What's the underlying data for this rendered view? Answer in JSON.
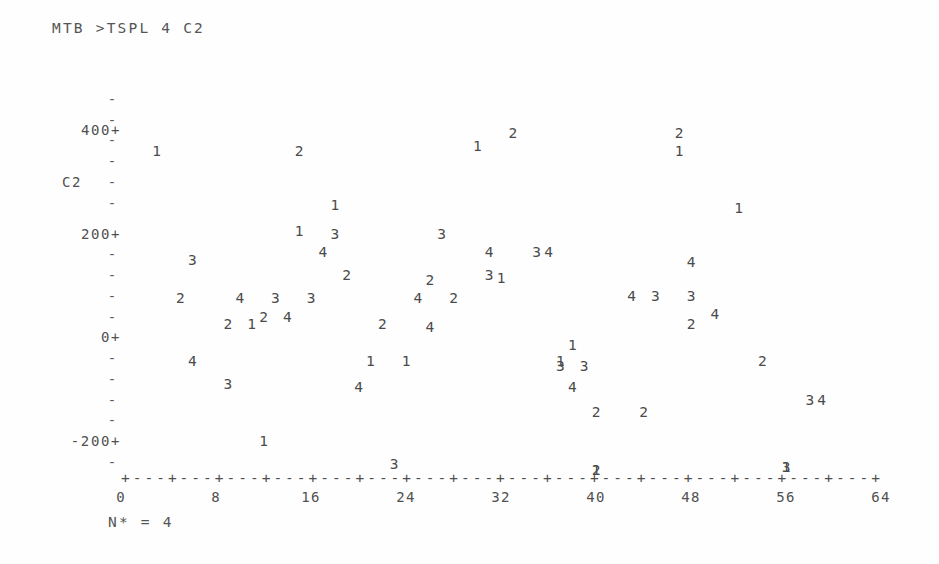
{
  "command": {
    "prompt": "MTB >",
    "text": "MTB >TSPL 4 C2"
  },
  "footer": {
    "missing_note": "N* = 4"
  },
  "chart_data": {
    "type": "scatter",
    "title": "MTB >TSPL 4 C2",
    "subtitle": "",
    "xlabel": "",
    "ylabel": "C2",
    "plot_style": "minitab-character-timeseries-plot",
    "grid": false,
    "legend": "none",
    "point_glyphs": "digit 1-4 marks season/series index within each period of 4",
    "xlim": [
      0,
      64
    ],
    "ylim": [
      -260,
      470
    ],
    "x_tick_interval": 4,
    "x_labeled_interval": 8,
    "x_tick_labels": [
      "0",
      "8",
      "16",
      "24",
      "32",
      "40",
      "48",
      "56",
      "64"
    ],
    "x_tick_values": [
      0,
      8,
      16,
      24,
      32,
      40,
      48,
      56,
      64
    ],
    "y_tick_labels": [
      "400+",
      "200+",
      "0+",
      "-200+"
    ],
    "y_tick_values": [
      400,
      200,
      0,
      -200
    ],
    "y_minor_tick_values": [
      460,
      420,
      380,
      340,
      300,
      260,
      160,
      120,
      80,
      40,
      -40,
      -80,
      -120,
      -160,
      -240
    ],
    "axis_line_glyph": "+---+---+---+---+---+---+---+---+---+---+---+---+---+---+---+---+",
    "annotations": [
      "N* = 4"
    ],
    "points": [
      {
        "label": "1",
        "x": 3,
        "y": 360
      },
      {
        "label": "2",
        "x": 15,
        "y": 360
      },
      {
        "label": "3",
        "x": 6,
        "y": 150
      },
      {
        "label": "2",
        "x": 5,
        "y": 75
      },
      {
        "label": "4",
        "x": 6,
        "y": -45
      },
      {
        "label": "3",
        "x": 9,
        "y": -90
      },
      {
        "label": "2",
        "x": 9,
        "y": 25
      },
      {
        "label": "1",
        "x": 11,
        "y": 25
      },
      {
        "label": "4",
        "x": 10,
        "y": 75
      },
      {
        "label": "2",
        "x": 12,
        "y": 40
      },
      {
        "label": "1",
        "x": 12,
        "y": -200
      },
      {
        "label": "3",
        "x": 13,
        "y": 75
      },
      {
        "label": "4",
        "x": 14,
        "y": 40
      },
      {
        "label": "1",
        "x": 15,
        "y": 205
      },
      {
        "label": "3",
        "x": 16,
        "y": 75
      },
      {
        "label": "1",
        "x": 18,
        "y": 255
      },
      {
        "label": "3",
        "x": 18,
        "y": 200
      },
      {
        "label": "4",
        "x": 17,
        "y": 165
      },
      {
        "label": "2",
        "x": 19,
        "y": 120
      },
      {
        "label": "4",
        "x": 20,
        "y": -95
      },
      {
        "label": "1",
        "x": 21,
        "y": -45
      },
      {
        "label": "2",
        "x": 22,
        "y": 25
      },
      {
        "label": "3",
        "x": 23,
        "y": -245
      },
      {
        "label": "1",
        "x": 24,
        "y": -45
      },
      {
        "label": "4",
        "x": 25,
        "y": 75
      },
      {
        "label": "2",
        "x": 26,
        "y": 110
      },
      {
        "label": "4",
        "x": 26,
        "y": 20
      },
      {
        "label": "3",
        "x": 27,
        "y": 200
      },
      {
        "label": "2",
        "x": 28,
        "y": 75
      },
      {
        "label": "1",
        "x": 30,
        "y": 370
      },
      {
        "label": "3",
        "x": 31,
        "y": 120
      },
      {
        "label": "1",
        "x": 32,
        "y": 115
      },
      {
        "label": "4",
        "x": 31,
        "y": 165
      },
      {
        "label": "2",
        "x": 33,
        "y": 395
      },
      {
        "label": "3",
        "x": 35,
        "y": 165
      },
      {
        "label": "4",
        "x": 36,
        "y": 165
      },
      {
        "label": "1",
        "x": 37,
        "y": -45
      },
      {
        "label": "3",
        "x": 37,
        "y": -55
      },
      {
        "label": "3",
        "x": 39,
        "y": -55
      },
      {
        "label": "4",
        "x": 38,
        "y": -95
      },
      {
        "label": "1",
        "x": 38,
        "y": -15
      },
      {
        "label": "2",
        "x": 40,
        "y": -145
      },
      {
        "label": "1",
        "x": 40,
        "y": -255
      },
      {
        "label": "2",
        "x": 40,
        "y": -255
      },
      {
        "label": "4",
        "x": 43,
        "y": 80
      },
      {
        "label": "3",
        "x": 45,
        "y": 80
      },
      {
        "label": "2",
        "x": 44,
        "y": -145
      },
      {
        "label": "1",
        "x": 47,
        "y": 360
      },
      {
        "label": "2",
        "x": 47,
        "y": 395
      },
      {
        "label": "4",
        "x": 48,
        "y": 145
      },
      {
        "label": "3",
        "x": 48,
        "y": 80
      },
      {
        "label": "2",
        "x": 48,
        "y": 25
      },
      {
        "label": "1",
        "x": 52,
        "y": 250
      },
      {
        "label": "4",
        "x": 50,
        "y": 45
      },
      {
        "label": "2",
        "x": 54,
        "y": -45
      },
      {
        "label": "3",
        "x": 56,
        "y": -250
      },
      {
        "label": "1",
        "x": 56,
        "y": -250
      },
      {
        "label": "3",
        "x": 58,
        "y": -120
      },
      {
        "label": "4",
        "x": 59,
        "y": -120
      }
    ]
  }
}
